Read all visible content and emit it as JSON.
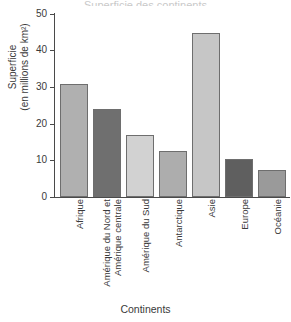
{
  "figure": {
    "clipped_title": "Superficie des continents",
    "x_axis_title": "Continents",
    "y_axis_title_line1": "Superficie",
    "y_axis_title_line2": "(en millions de km²)"
  },
  "chart_data": {
    "type": "bar",
    "title": "",
    "xlabel": "Continents",
    "ylabel": "Superficie (en millions de km²)",
    "ylim": [
      0,
      50
    ],
    "yticks": [
      0,
      10,
      20,
      30,
      40,
      50
    ],
    "grid": false,
    "legend": "none",
    "categories": [
      "Afrique",
      "Amérique du Nord et\nAmérique centrale",
      "Amérique du Sud",
      "Antarctique",
      "Asie",
      "Europe",
      "Océanie"
    ],
    "values": [
      30.8,
      24.0,
      17.0,
      12.7,
      44.7,
      10.5,
      7.5
    ],
    "colors": [
      "#b0b0b0",
      "#6f6f6f",
      "#d2d2d2",
      "#adadad",
      "#c6c6c6",
      "#5f5f5f",
      "#9a9a9a"
    ],
    "bar_edge_color": "#6e6e6e"
  },
  "ticklabels": {
    "t0": "0",
    "t1": "10",
    "t2": "20",
    "t3": "30",
    "t4": "40",
    "t5": "50"
  },
  "xlabels": {
    "l0": "Afrique",
    "l1": "Amérique du Nord et\nAmérique centrale",
    "l2": "Amérique du Sud",
    "l3": "Antarctique",
    "l4": "Asie",
    "l5": "Europe",
    "l6": "Océanie"
  }
}
